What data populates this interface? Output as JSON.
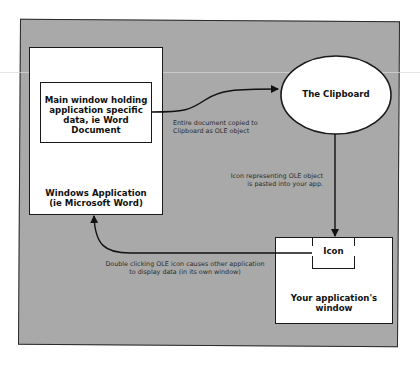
{
  "diagram": {
    "nodes": {
      "windows_app": {
        "label_line1": "Windows Application",
        "label_line2": "(ie Microsoft Word)"
      },
      "main_window": {
        "label_line1": "Main window holding",
        "label_line2": "application specific",
        "label_line3": "data, ie Word Document"
      },
      "clipboard": {
        "label": "The Clipboard"
      },
      "your_app": {
        "label_line1": "Your application's",
        "label_line2": "window"
      },
      "icon": {
        "label": "Icon"
      }
    },
    "edges": {
      "copy": {
        "from": "main_window",
        "to": "clipboard",
        "label_line1": "Entire document copied to",
        "label_line2": "Clipboard as OLE object"
      },
      "paste": {
        "from": "clipboard",
        "to": "your_app",
        "label_line1": "Icon representing OLE object",
        "label_line2": "is pasted into your app."
      },
      "activate": {
        "from": "icon",
        "to": "windows_app",
        "label_line1": "Double clicking OLE icon causes other application",
        "label_line2": "to display data (in its own window)"
      }
    },
    "colors": {
      "panel": "#a9a9a9",
      "box_fill": "#ffffff",
      "stroke": "#1a1a1a"
    }
  }
}
